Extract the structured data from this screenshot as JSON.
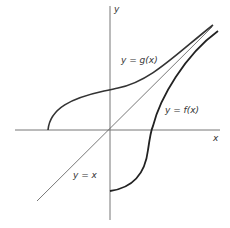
{
  "diagram": {
    "axes": {
      "x_label": "x",
      "y_label": "y"
    },
    "curves": [
      {
        "name": "g",
        "label": "y = g(x)"
      },
      {
        "name": "f",
        "label": "y = f(x)"
      },
      {
        "name": "identity",
        "label": "y = x"
      }
    ],
    "colors": {
      "axes": "#777777",
      "curve": "#333333",
      "diagonal": "#555555"
    }
  }
}
